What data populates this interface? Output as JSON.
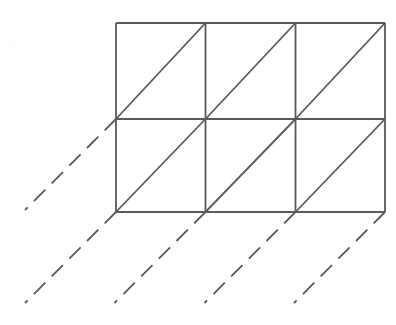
{
  "figure": {
    "kind": "line-diagram",
    "canvas": {
      "width": 396,
      "height": 325,
      "background_color": "#ffffff"
    },
    "style": {
      "solid_line_color": "#5a5a5e",
      "dashed_line_color": "#5a5a5e",
      "solid_line_width": 1.8,
      "dashed_line_width": 1.8,
      "dash_length": 16,
      "dash_gap": 9
    },
    "grid": {
      "columns": 3,
      "rows": 2,
      "cell_width": 90,
      "cell_height": 94,
      "x_lines": [
        116,
        205.5,
        295.5,
        385
      ],
      "y_lines": [
        23,
        119,
        212
      ],
      "left": 116,
      "right": 385,
      "top": 23,
      "bottom": 212
    },
    "outer_border": {
      "points": "116,23 385,23 385,212 116,212"
    },
    "vertical_lines": [
      {
        "name": "outer-left-edge",
        "x1": 116,
        "y1": 23,
        "x2": 116,
        "y2": 212
      },
      {
        "name": "inner-vertical-1",
        "x1": 205.5,
        "y1": 23,
        "x2": 205.5,
        "y2": 212
      },
      {
        "name": "inner-vertical-2",
        "x1": 295.5,
        "y1": 23,
        "x2": 295.5,
        "y2": 212
      },
      {
        "name": "outer-right-edge",
        "x1": 385,
        "y1": 23,
        "x2": 385,
        "y2": 212
      }
    ],
    "horizontal_lines": [
      {
        "name": "outer-top-edge",
        "x1": 116,
        "y1": 23,
        "x2": 385,
        "y2": 23
      },
      {
        "name": "inner-horizontal-1",
        "x1": 116,
        "y1": 119,
        "x2": 385,
        "y2": 119
      },
      {
        "name": "outer-bottom-edge",
        "x1": 116,
        "y1": 212,
        "x2": 385,
        "y2": 212
      }
    ],
    "cell_diagonals": [
      {
        "name": "diagonal-row1-col1",
        "x1": 116,
        "y1": 119,
        "x2": 205.5,
        "y2": 23
      },
      {
        "name": "diagonal-row1-col2",
        "x1": 205.5,
        "y1": 119,
        "x2": 295.5,
        "y2": 23
      },
      {
        "name": "diagonal-row1-col3",
        "x1": 295.5,
        "y1": 119,
        "x2": 385,
        "y2": 23
      },
      {
        "name": "diagonal-row2-col1",
        "x1": 116,
        "y1": 212,
        "x2": 205.5,
        "y2": 119
      },
      {
        "name": "diagonal-row2-col2",
        "x1": 205.5,
        "y1": 212,
        "x2": 295.5,
        "y2": 119
      },
      {
        "name": "diagonal-row2-col3",
        "x1": 295.5,
        "y1": 212,
        "x2": 385,
        "y2": 119
      }
    ],
    "dashed_projection_lines": [
      {
        "name": "dashed-line-from-mid-left-vertex",
        "x1": 116,
        "y1": 119,
        "x2": 25,
        "y2": 210
      },
      {
        "name": "dashed-line-from-bottom-left-vertex",
        "x1": 116,
        "y1": 212,
        "x2": 25,
        "y2": 303
      },
      {
        "name": "dashed-line-from-bottom-vertex-2",
        "x1": 205.5,
        "y1": 212,
        "x2": 114.5,
        "y2": 303
      },
      {
        "name": "dashed-line-from-bottom-vertex-3",
        "x1": 295.5,
        "y1": 212,
        "x2": 204.5,
        "y2": 303
      },
      {
        "name": "dashed-line-from-bottom-right-vertex",
        "x1": 385,
        "y1": 212,
        "x2": 294,
        "y2": 303
      }
    ],
    "faint_artifact": {
      "name": "faint-speck",
      "x": 5,
      "y": 39,
      "width": 7,
      "height": 5
    }
  }
}
